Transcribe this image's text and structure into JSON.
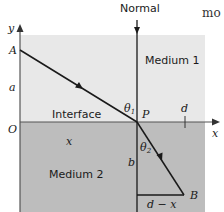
{
  "diagram": {
    "normal_label": "Normal",
    "medium1_label": "Medium 1",
    "medium2_label": "Medium 2",
    "interface_label": "Interface",
    "cropped_text": "mo",
    "axis_x_label": "x",
    "axis_y_label": "y",
    "origin_label": "O",
    "point_A": "A",
    "point_P": "P",
    "point_B": "B",
    "length_a": "a",
    "length_b": "b",
    "length_x": "x",
    "length_d": "d",
    "length_d_minus_x": "d − x",
    "angle_1": "θ",
    "angle_1_sub": "1",
    "angle_2": "θ",
    "angle_2_sub": "2",
    "colors": {
      "medium1": "#e8e8e8",
      "medium2": "#bdbdbd",
      "lines": "#1a1a1a"
    }
  }
}
